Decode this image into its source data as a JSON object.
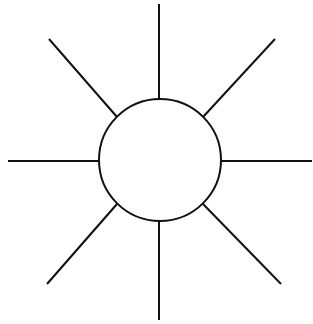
{
  "diagram": {
    "type": "sun-burst",
    "stroke_color": "#111111",
    "background": "#ffffff",
    "circle": {
      "cx": 160,
      "cy": 160,
      "r": 61
    },
    "rays": [
      {
        "name": "ray-north",
        "x1": 159,
        "y1": 4,
        "x2": 159,
        "y2": 99
      },
      {
        "name": "ray-northeast",
        "x1": 275,
        "y1": 39,
        "x2": 203,
        "y2": 117
      },
      {
        "name": "ray-east",
        "x1": 312,
        "y1": 161,
        "x2": 221,
        "y2": 161
      },
      {
        "name": "ray-southeast",
        "x1": 281,
        "y1": 284,
        "x2": 203,
        "y2": 204
      },
      {
        "name": "ray-south",
        "x1": 159,
        "y1": 320,
        "x2": 159,
        "y2": 221
      },
      {
        "name": "ray-southwest",
        "x1": 47,
        "y1": 284,
        "x2": 117,
        "y2": 204
      },
      {
        "name": "ray-west",
        "x1": 8,
        "y1": 161,
        "x2": 99,
        "y2": 161
      },
      {
        "name": "ray-northwest",
        "x1": 49,
        "y1": 39,
        "x2": 117,
        "y2": 117
      }
    ]
  }
}
